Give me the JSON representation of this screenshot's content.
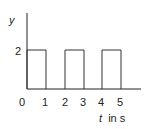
{
  "chart_data": {
    "type": "line",
    "title": "",
    "xlabel": "t in s",
    "xlabel_var": "t",
    "xlabel_unit": "in s",
    "ylabel": "y",
    "x_ticks": [
      "0",
      "1",
      "2",
      "3",
      "4",
      "5"
    ],
    "y_ticks": [
      "2"
    ],
    "xlim": [
      0,
      6
    ],
    "ylim": [
      0,
      3
    ],
    "grid": false,
    "legend": null,
    "series": [
      {
        "name": "rectangular pulse train",
        "style": "step",
        "x": [
          0,
          0,
          1,
          1,
          2,
          2,
          3,
          3,
          4,
          4,
          5,
          5,
          6
        ],
        "y": [
          0,
          2,
          2,
          0,
          0,
          2,
          2,
          0,
          0,
          2,
          2,
          0,
          0
        ]
      }
    ],
    "pulses": [
      {
        "start": 0,
        "end": 1,
        "amplitude": 2
      },
      {
        "start": 2,
        "end": 3,
        "amplitude": 2
      },
      {
        "start": 4,
        "end": 5,
        "amplitude": 2
      }
    ],
    "colors": {
      "axis": "#222222",
      "signal": "#333333"
    }
  }
}
